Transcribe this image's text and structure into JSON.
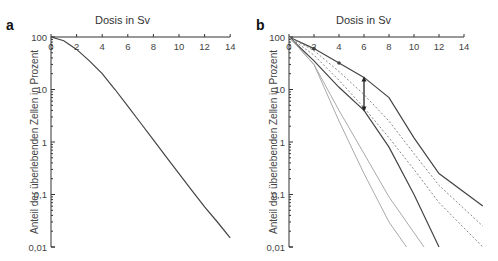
{
  "chart_data": [
    {
      "panel": "a",
      "type": "line",
      "title": "Dosis in Sv",
      "xlabel": "Dosis in Sv",
      "ylabel": "Anteil der überlebenden Zellen in Prozent",
      "xticks": [
        "0",
        "2",
        "4",
        "6",
        "8",
        "10",
        "12",
        "14"
      ],
      "yticks": [
        "100",
        "10",
        "1",
        "0,1",
        "0,01"
      ],
      "xlim": [
        0,
        14
      ],
      "ylim": [
        0.01,
        100
      ],
      "yscale": "log",
      "grid": false,
      "series": [
        {
          "name": "survival",
          "style": "solid-dark",
          "x": [
            0,
            1,
            2,
            3,
            4,
            5,
            6,
            7,
            8,
            9,
            10,
            11,
            12,
            13,
            14
          ],
          "y": [
            100,
            85,
            58,
            35,
            20,
            10,
            4.8,
            2.3,
            1.1,
            0.52,
            0.25,
            0.12,
            0.058,
            0.03,
            0.015
          ]
        }
      ]
    },
    {
      "panel": "b",
      "type": "line",
      "title": "Dosis in Sv",
      "xlabel": "Dosis in Sv",
      "ylabel": "Anteil der überlebenden Zellen in Prozent",
      "xticks": [
        "0",
        "2",
        "4",
        "6",
        "8",
        "10",
        "12",
        "14"
      ],
      "yticks": [
        "100",
        "10",
        "1",
        "0,1",
        "0,01"
      ],
      "xlim": [
        0,
        14
      ],
      "ylim": [
        0.01,
        100
      ],
      "yscale": "log",
      "grid": false,
      "annotations": [
        {
          "type": "double-arrow",
          "x": 6,
          "y_from": 17,
          "y_to": 4
        }
      ],
      "series": [
        {
          "name": "fractionated 2 Sv (upper)",
          "style": "solid-dark",
          "x": [
            0,
            2,
            4,
            6,
            8,
            10,
            12,
            15.5
          ],
          "y": [
            100,
            60,
            32,
            17,
            7,
            1.2,
            0.25,
            0.06
          ]
        },
        {
          "name": "dotted upper",
          "style": "dotted",
          "x": [
            0,
            2,
            4,
            6,
            8,
            10,
            12,
            15.5
          ],
          "y": [
            100,
            55,
            22,
            8,
            2.5,
            0.6,
            0.15,
            0.025
          ]
        },
        {
          "name": "dotted lower",
          "style": "dotted",
          "x": [
            0,
            2,
            4,
            6,
            8,
            10,
            12,
            15.5
          ],
          "y": [
            100,
            45,
            15,
            4.5,
            1.2,
            0.3,
            0.07,
            0.01
          ]
        },
        {
          "name": "fractionated (lower)",
          "style": "solid-dark",
          "x": [
            0,
            2,
            4,
            6,
            8,
            10,
            12
          ],
          "y": [
            100,
            35,
            11,
            4,
            0.8,
            0.1,
            0.01
          ]
        },
        {
          "name": "light line 1",
          "style": "solid-light",
          "x": [
            0,
            2,
            4,
            6,
            8,
            10.8
          ],
          "y": [
            100,
            30,
            4,
            0.6,
            0.09,
            0.01
          ]
        },
        {
          "name": "light line 2",
          "style": "solid-light",
          "x": [
            0,
            2,
            4,
            6,
            8,
            9.4
          ],
          "y": [
            100,
            30,
            2.5,
            0.25,
            0.03,
            0.01
          ]
        }
      ]
    }
  ],
  "panels": {
    "a": {
      "letter": "a",
      "title": "Dosis in Sv",
      "ylabel": "Anteil der überlebenden Zellen in Prozent"
    },
    "b": {
      "letter": "b",
      "title": "Dosis in Sv",
      "ylabel": "Anteil der überlebenden Zellen in Prozent"
    }
  },
  "axis": {
    "xticks": [
      "0",
      "2",
      "4",
      "6",
      "8",
      "10",
      "12",
      "14"
    ],
    "yticks": [
      "100",
      "10",
      "1",
      "0,1",
      "0,01"
    ]
  },
  "colors": {
    "dark": "#444444",
    "light": "#aaaaaa",
    "dotted": "#888888",
    "axis": "#333333"
  }
}
